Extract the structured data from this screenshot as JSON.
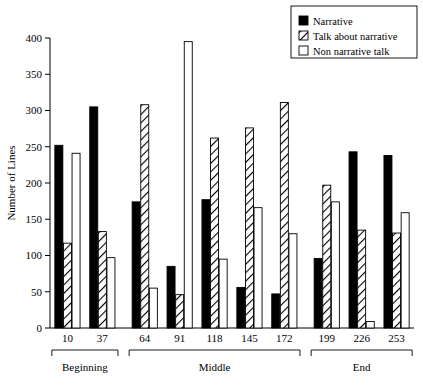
{
  "chart_data": {
    "type": "bar",
    "title": "",
    "subtitle": "",
    "xlabel": "",
    "ylabel": "Number of Lines",
    "ylim": [
      0,
      400
    ],
    "yticks": [
      0,
      50,
      100,
      150,
      200,
      250,
      300,
      350,
      400
    ],
    "ytick_labels": [
      "0",
      "50",
      "100",
      "150",
      "200",
      "250",
      "300",
      "350",
      "400"
    ],
    "grid": false,
    "legend_position": "top-right",
    "categories": [
      "10",
      "37",
      "64",
      "91",
      "118",
      "145",
      "172",
      "199",
      "226",
      "253"
    ],
    "series": [
      {
        "name": "Narrative",
        "style": "solid-black",
        "color": "#000000",
        "values": [
          252,
          305,
          174,
          85,
          177,
          56,
          47,
          96,
          243,
          238
        ]
      },
      {
        "name": "Talk about narrative",
        "style": "hatched",
        "color": "#ffffff",
        "values": [
          117,
          133,
          308,
          46,
          262,
          276,
          311,
          197,
          135,
          131
        ]
      },
      {
        "name": "Non narrative talk",
        "style": "open-white",
        "color": "#ffffff",
        "values": [
          241,
          97,
          55,
          395,
          95,
          166,
          130,
          174,
          9,
          159
        ]
      }
    ],
    "group_brackets": [
      {
        "label": "Beginning",
        "categories": [
          "10",
          "37"
        ]
      },
      {
        "label": "Middle",
        "categories": [
          "64",
          "91",
          "118",
          "145",
          "172"
        ]
      },
      {
        "label": "End",
        "categories": [
          "199",
          "226",
          "253"
        ]
      }
    ]
  },
  "legend": {
    "items": [
      {
        "label": "Narrative",
        "swatch": "solid-black"
      },
      {
        "label": "Talk about narrative",
        "swatch": "hatched"
      },
      {
        "label": "Non narrative talk",
        "swatch": "open-white"
      }
    ]
  },
  "axes": {
    "y_title": "Number of Lines"
  }
}
